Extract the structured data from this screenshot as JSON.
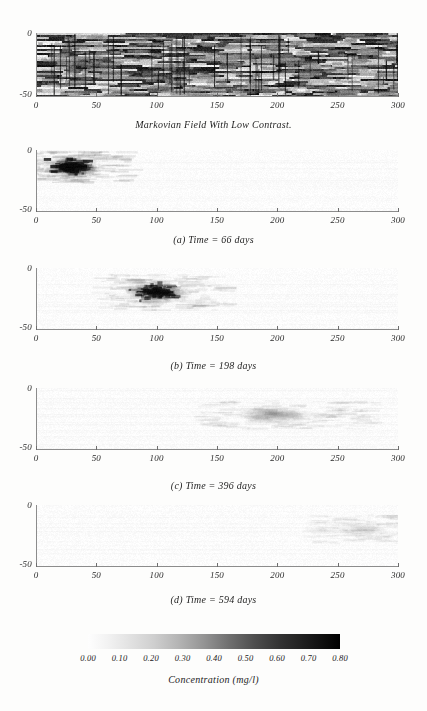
{
  "figure": {
    "title": "Markovian Field With Low Contrast.",
    "domain": "Contaminant transport simulation"
  },
  "axes": {
    "x_ticks": [
      "0",
      "50",
      "100",
      "150",
      "200",
      "250",
      "300"
    ],
    "x_values": [
      0,
      50,
      100,
      150,
      200,
      250,
      300
    ],
    "y_ticks": [
      "0",
      "-50"
    ],
    "y_values": [
      0,
      -50
    ]
  },
  "panels": [
    {
      "id": "markovian-field",
      "caption": "Markovian Field With Low Contrast.",
      "kind": "conductivity-field"
    },
    {
      "id": "panel-a",
      "caption": "(a) Time = 66 days",
      "label": "(a)",
      "time_days": 66,
      "kind": "concentration-plume"
    },
    {
      "id": "panel-b",
      "caption": "(b) Time = 198 days",
      "label": "(b)",
      "time_days": 198,
      "kind": "concentration-plume"
    },
    {
      "id": "panel-c",
      "caption": "(c) Time = 396 days",
      "label": "(c)",
      "time_days": 396,
      "kind": "concentration-plume"
    },
    {
      "id": "panel-d",
      "caption": "(d) Time = 594 days",
      "label": "(d)",
      "time_days": 594,
      "kind": "concentration-plume"
    }
  ],
  "colorbar": {
    "title": "Concentration (mg/l)",
    "ticks": [
      "0.00",
      "0.10",
      "0.20",
      "0.30",
      "0.40",
      "0.50",
      "0.60",
      "0.70",
      "0.80"
    ],
    "values": [
      0.0,
      0.1,
      0.2,
      0.3,
      0.4,
      0.5,
      0.6,
      0.7,
      0.8
    ],
    "min": 0.0,
    "max": 0.8,
    "low_color": "#ffffff",
    "high_color": "#000000"
  },
  "chart_data": {
    "type": "heatmap",
    "title": "Markovian Field With Low Contrast.",
    "xlabel": "",
    "ylabel": "",
    "xlim": [
      0,
      300
    ],
    "ylim": [
      -50,
      0
    ],
    "grid": false,
    "colormap": "grayscale-inverted",
    "colorbar": {
      "label": "Concentration (mg/l)",
      "ticks": [
        0.0,
        0.1,
        0.2,
        0.3,
        0.4,
        0.5,
        0.6,
        0.7,
        0.8
      ],
      "vmin": 0.0,
      "vmax": 0.8
    },
    "subplots": [
      {
        "name": "Markovian Field With Low Contrast.",
        "type": "heatmap",
        "description": "Horizontally-stratified binary/low-contrast random hydraulic conductivity field spanning the full 0-300 by -50-0 domain",
        "xlim": [
          0,
          300
        ],
        "ylim": [
          -50,
          0
        ]
      },
      {
        "name": "(a) Time = 66 days",
        "type": "heatmap",
        "time_days": 66,
        "plume_center_x": 30,
        "plume_center_y": -14,
        "plume_extent_x": [
          5,
          60
        ],
        "plume_extent_y": [
          -28,
          -4
        ],
        "peak_concentration": 0.8,
        "xlim": [
          0,
          300
        ],
        "ylim": [
          -50,
          0
        ]
      },
      {
        "name": "(b) Time = 198 days",
        "type": "heatmap",
        "time_days": 198,
        "plume_center_x": 100,
        "plume_center_y": -20,
        "plume_extent_x": [
          70,
          140
        ],
        "plume_extent_y": [
          -36,
          -8
        ],
        "peak_concentration": 0.55,
        "xlim": [
          0,
          300
        ],
        "ylim": [
          -50,
          0
        ]
      },
      {
        "name": "(c) Time = 396 days",
        "type": "heatmap",
        "time_days": 396,
        "plume_center_x": 198,
        "plume_center_y": -22,
        "plume_extent_x": [
          155,
          250
        ],
        "plume_extent_y": [
          -34,
          -12
        ],
        "peak_concentration": 0.3,
        "xlim": [
          0,
          300
        ],
        "ylim": [
          -50,
          0
        ]
      },
      {
        "name": "(d) Time = 594 days",
        "type": "heatmap",
        "time_days": 594,
        "plume_center_x": 272,
        "plume_center_y": -20,
        "plume_extent_x": [
          235,
          300
        ],
        "plume_extent_y": [
          -32,
          -10
        ],
        "peak_concentration": 0.14,
        "xlim": [
          0,
          300
        ],
        "ylim": [
          -50,
          0
        ]
      }
    ]
  }
}
